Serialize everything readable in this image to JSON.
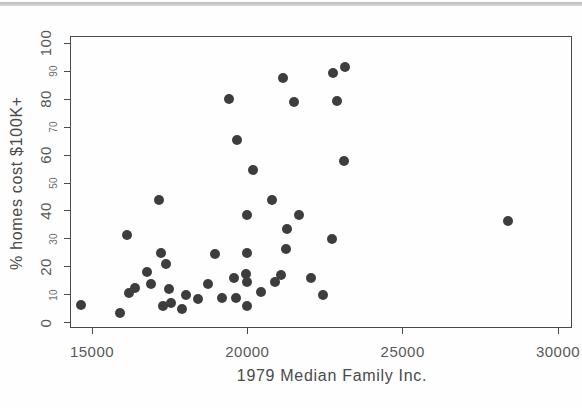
{
  "figure": {
    "kind": "r-base-scatterplot",
    "background": "#fefefe",
    "top_rule_color": "#c6c6c6"
  },
  "chart_data": {
    "type": "scatter",
    "title": "",
    "xlabel": "1979 Median Family Inc.",
    "ylabel": "% homes cost $100K+",
    "xlim": [
      14290,
      30450
    ],
    "ylim": [
      -2,
      102.6
    ],
    "grid": false,
    "legend": "none",
    "marker": {
      "shape": "filled-circle",
      "color": "#3d3d3d",
      "diameter_px": 10
    },
    "axis_color": "#4a4a4a",
    "x_ticks": [
      {
        "value": 15000,
        "label": "15000"
      },
      {
        "value": 20000,
        "label": "20000"
      },
      {
        "value": 25000,
        "label": "25000"
      },
      {
        "value": 30000,
        "label": "30000"
      }
    ],
    "y_ticks": [
      {
        "value": 0,
        "label": "0",
        "size": "major"
      },
      {
        "value": 10,
        "label": "10",
        "size": "minor"
      },
      {
        "value": 20,
        "label": "20",
        "size": "major"
      },
      {
        "value": 30,
        "label": "30",
        "size": "minor"
      },
      {
        "value": 40,
        "label": "40",
        "size": "major"
      },
      {
        "value": 50,
        "label": "50",
        "size": "minor"
      },
      {
        "value": 60,
        "label": "60",
        "size": "major"
      },
      {
        "value": 70,
        "label": "70",
        "size": "minor"
      },
      {
        "value": 80,
        "label": "80",
        "size": "major"
      },
      {
        "value": 90,
        "label": "90",
        "size": "minor"
      },
      {
        "value": 100,
        "label": "100",
        "size": "major"
      }
    ],
    "points": [
      [
        14650,
        6.5
      ],
      [
        15900,
        3.5
      ],
      [
        16140,
        31.5
      ],
      [
        16180,
        10.5
      ],
      [
        16390,
        12.5
      ],
      [
        16780,
        18
      ],
      [
        16910,
        14
      ],
      [
        17170,
        44
      ],
      [
        17230,
        25
      ],
      [
        17290,
        6
      ],
      [
        17370,
        21
      ],
      [
        17470,
        12
      ],
      [
        17530,
        7
      ],
      [
        17900,
        5
      ],
      [
        18040,
        10
      ],
      [
        18410,
        8.5
      ],
      [
        18730,
        14
      ],
      [
        18950,
        24.5
      ],
      [
        19200,
        9
      ],
      [
        19420,
        80
      ],
      [
        19570,
        16
      ],
      [
        19650,
        9
      ],
      [
        19680,
        65.5
      ],
      [
        19950,
        17.5
      ],
      [
        19980,
        14.5
      ],
      [
        19980,
        25
      ],
      [
        19980,
        38.5
      ],
      [
        20000,
        6
      ],
      [
        20170,
        54.5
      ],
      [
        20450,
        11
      ],
      [
        20780,
        44
      ],
      [
        20880,
        14.5
      ],
      [
        21090,
        17
      ],
      [
        21140,
        87.5
      ],
      [
        21245,
        26.5
      ],
      [
        21290,
        33.5
      ],
      [
        21500,
        79
      ],
      [
        21670,
        38.5
      ],
      [
        22060,
        16
      ],
      [
        22420,
        10
      ],
      [
        22716,
        30
      ],
      [
        22750,
        89.5
      ],
      [
        22900,
        79.5
      ],
      [
        23110,
        58
      ],
      [
        23140,
        91.5
      ],
      [
        28390,
        36.5
      ]
    ]
  }
}
